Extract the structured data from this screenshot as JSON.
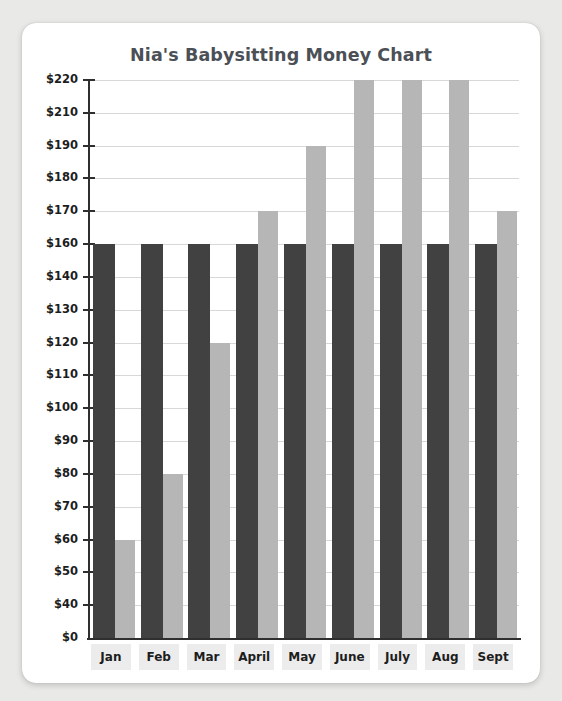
{
  "card": {
    "title": "Nia's Babysitting Money Chart"
  },
  "colors": {
    "page_background": "#e9e9e7",
    "card_background": "#ffffff",
    "title_text": "#4b4f56",
    "axis": "#2f2f2f",
    "gridline": "#d8d8d8",
    "bar_dark": "#414141",
    "bar_light": "#b6b6b6",
    "xlabel_background": "#ececec",
    "tick_text": "#1d1d1d"
  },
  "chart_data": {
    "type": "bar",
    "title": "Nia's Babysitting Money Chart",
    "xlabel": "",
    "ylabel": "",
    "categories": [
      "Jan",
      "Feb",
      "Mar",
      "April",
      "May",
      "June",
      "July",
      "Aug",
      "Sept"
    ],
    "series": [
      {
        "name": "Goal",
        "color": "#414141",
        "values": [
          160,
          160,
          160,
          160,
          160,
          160,
          160,
          160,
          160
        ]
      },
      {
        "name": "Earned",
        "color": "#b6b6b6",
        "values": [
          60,
          80,
          120,
          170,
          190,
          220,
          220,
          220,
          170
        ]
      }
    ],
    "ytick_labels": [
      "$220",
      "$210",
      "$190",
      "$180",
      "$170",
      "$160",
      "$140",
      "$130",
      "$120",
      "$110",
      "$100",
      "$90",
      "$80",
      "$70",
      "$60",
      "$50",
      "$40",
      "$0"
    ],
    "ytick_values": [
      220,
      210,
      190,
      180,
      170,
      160,
      140,
      130,
      120,
      110,
      100,
      90,
      80,
      70,
      60,
      50,
      40,
      0
    ],
    "ylim": [
      0,
      220
    ],
    "grid": true,
    "legend": "none"
  }
}
